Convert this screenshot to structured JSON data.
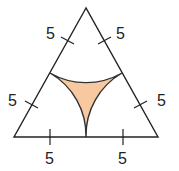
{
  "diagram": {
    "shape": "equilateral triangle",
    "colors": {
      "stroke": "#222222",
      "fill_region": "#f8c9a0",
      "background": "#ffffff"
    },
    "labels": {
      "top_left": "5",
      "top_right": "5",
      "left": "5",
      "right": "5",
      "bottom_left": "5",
      "bottom_right": "5"
    }
  }
}
